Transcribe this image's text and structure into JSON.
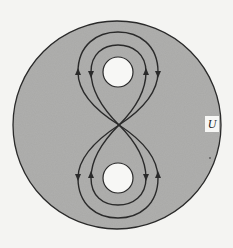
{
  "diagram": {
    "label": "U",
    "colors": {
      "background": "#f4f4f2",
      "region_fill": "#a9a9a7",
      "hole_fill": "#f7f7f5",
      "stroke": "#2a2a2a"
    },
    "region": {
      "shape": "disc",
      "cx": 117,
      "cy": 125,
      "r": 104
    },
    "holes": [
      {
        "name": "top-hole",
        "cx": 118,
        "cy": 72,
        "r": 15
      },
      {
        "name": "bottom-hole",
        "cx": 118,
        "cy": 178,
        "r": 15
      }
    ],
    "crossing_point": {
      "x": 119,
      "y": 125
    },
    "loops": [
      {
        "name": "top-outer",
        "arrows": [
          "left: up",
          "right: down"
        ]
      },
      {
        "name": "top-inner",
        "arrows": [
          "left: down",
          "right: up"
        ]
      },
      {
        "name": "bottom-outer",
        "arrows": [
          "left: down",
          "right: up"
        ]
      },
      {
        "name": "bottom-inner",
        "arrows": [
          "left: up",
          "right: down"
        ]
      }
    ]
  }
}
